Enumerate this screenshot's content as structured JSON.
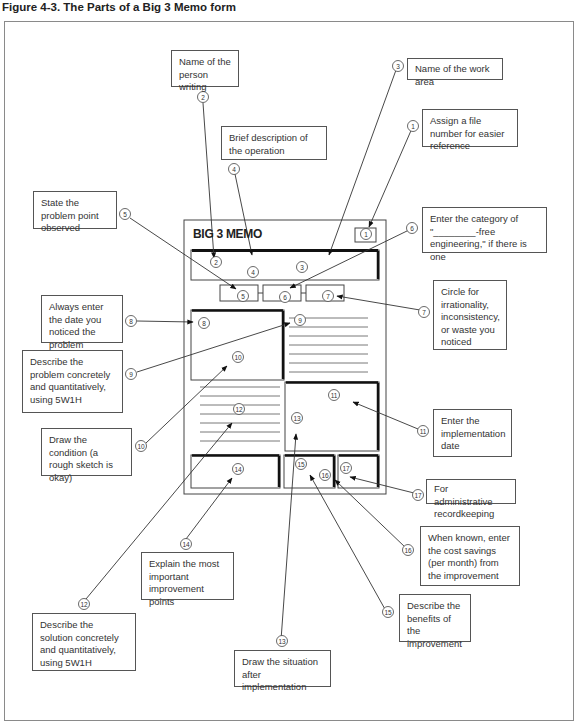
{
  "figure": {
    "title": "Figure 4-3. The Parts of a Big 3 Memo form"
  },
  "memo": {
    "title": "BIG 3 MEMO"
  },
  "callouts": [
    {
      "num": "1",
      "text": "Assign a file number for easier reference",
      "x": 422,
      "y": 110,
      "w": 96,
      "h": 37
    },
    {
      "num": "2",
      "text": "Name of the person writing",
      "x": 171,
      "y": 50,
      "w": 68,
      "h": 37
    },
    {
      "num": "3",
      "text": "Name of the work area",
      "x": 407,
      "y": 58,
      "w": 96,
      "h": 22
    },
    {
      "num": "4",
      "text": "Brief description of the operation",
      "x": 221,
      "y": 126,
      "w": 106,
      "h": 34
    },
    {
      "num": "5",
      "text": "State the problem point observed",
      "x": 33,
      "y": 191,
      "w": 84,
      "h": 38
    },
    {
      "num": "6",
      "text": "Enter the category of \"________-free engineering,\" if there is one",
      "x": 422,
      "y": 207,
      "w": 125,
      "h": 46
    },
    {
      "num": "7",
      "text": "Circle for irrationality, inconsistency, or waste you noticed",
      "x": 433,
      "y": 280,
      "w": 74,
      "h": 70
    },
    {
      "num": "8",
      "text": "Always enter the date you noticed the problem",
      "x": 41,
      "y": 295,
      "w": 82,
      "h": 48
    },
    {
      "num": "9",
      "text": "Describe the problem concretely and quantitatively, using 5W1H",
      "x": 22,
      "y": 350,
      "w": 101,
      "h": 63
    },
    {
      "num": "10",
      "text": "Draw the condition (a rough sketch is okay)",
      "x": 41,
      "y": 428,
      "w": 91,
      "h": 48
    },
    {
      "num": "11",
      "text": "Enter the implementation date",
      "x": 433,
      "y": 409,
      "w": 79,
      "h": 48
    },
    {
      "num": "12",
      "text": "Describe the solution concretely and quantitatively, using 5W1H",
      "x": 32,
      "y": 613,
      "w": 104,
      "h": 58
    },
    {
      "num": "13",
      "text": "Draw the situation after implementation",
      "x": 234,
      "y": 650,
      "w": 97,
      "h": 37
    },
    {
      "num": "14",
      "text": "Explain the most important improvement points",
      "x": 141,
      "y": 552,
      "w": 93,
      "h": 48
    },
    {
      "num": "15",
      "text": "Describe the benefits of the improvement",
      "x": 399,
      "y": 594,
      "w": 72,
      "h": 48
    },
    {
      "num": "16",
      "text": "When known, enter the cost savings (per month) from the improvement",
      "x": 420,
      "y": 526,
      "w": 100,
      "h": 60
    },
    {
      "num": "17",
      "text": "For administrative recordkeeping",
      "x": 426,
      "y": 480,
      "w": 90,
      "h": 24
    }
  ],
  "markers": {
    "memo_numbers": [
      "1",
      "2",
      "3",
      "4",
      "5",
      "6",
      "7",
      "8",
      "9",
      "10",
      "11",
      "12",
      "13",
      "14",
      "15",
      "16",
      "17"
    ]
  },
  "colors": {
    "line": "#333333",
    "border": "#555555",
    "frame": "#8a8a8a"
  }
}
